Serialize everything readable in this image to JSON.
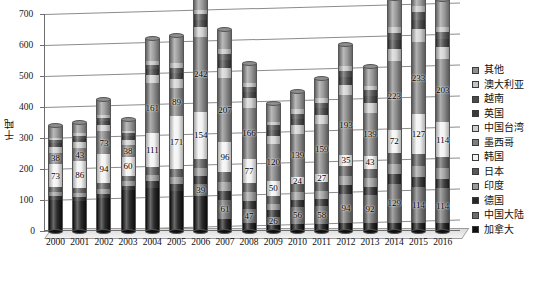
{
  "chart_data": {
    "type": "bar",
    "subtype": "stacked-column-3d",
    "title": "",
    "xlabel": "",
    "ylabel": "千吨",
    "ylim": [
      0,
      700
    ],
    "ytick_step": 100,
    "yticks": [
      0,
      100,
      200,
      300,
      400,
      500,
      600,
      700
    ],
    "grid": true,
    "legend_position": "right",
    "categories": [
      "2000",
      "2001",
      "2002",
      "2003",
      "2004",
      "2005",
      "2006",
      "2007",
      "2008",
      "2009",
      "2010",
      "2011",
      "2012",
      "2013",
      "2014",
      "2015",
      "2016"
    ],
    "series": [
      {
        "name": "加拿大",
        "color": "#101010",
        "values": [
          100,
          97,
          106,
          133,
          140,
          128,
          114,
          40,
          25,
          20,
          22,
          22,
          26,
          24,
          24,
          27,
          24
        ]
      },
      {
        "name": "中国大陆",
        "color": "#6d6d6d",
        "values": [
          0,
          0,
          0,
          0,
          0,
          0,
          39,
          61,
          47,
          26,
          56,
          58,
          94,
          92,
          129,
          114,
          114
        ]
      },
      {
        "name": "德国",
        "color": "#272727",
        "values": [
          12,
          12,
          14,
          13,
          20,
          22,
          24,
          27,
          25,
          20,
          22,
          24,
          28,
          26,
          30,
          34,
          30
        ]
      },
      {
        "name": "印度",
        "color": "#9a9a9a",
        "values": [
          14,
          14,
          16,
          15,
          22,
          24,
          26,
          30,
          28,
          22,
          24,
          26,
          30,
          28,
          34,
          36,
          34
        ]
      },
      {
        "name": "日本",
        "color": "#585858",
        "values": [
          16,
          16,
          18,
          17,
          24,
          26,
          28,
          32,
          30,
          24,
          26,
          28,
          32,
          30,
          36,
          38,
          36
        ]
      },
      {
        "name": "韩国",
        "color": "#f2f2f2",
        "values": [
          73,
          86,
          94,
          60,
          111,
          171,
          154,
          96,
          77,
          50,
          24,
          27,
          35,
          43,
          72,
          127,
          114
        ]
      },
      {
        "name": "墨西哥",
        "color": "#7e7e7e",
        "values": [
          38,
          43,
          73,
          38,
          161,
          89,
          242,
          207,
          166,
          120,
          139,
          159,
          193,
          139,
          223,
          233,
          203
        ]
      },
      {
        "name": "中国台湾",
        "color": "#cfcfcf",
        "values": [
          18,
          18,
          20,
          18,
          26,
          30,
          32,
          34,
          30,
          26,
          28,
          30,
          34,
          32,
          40,
          42,
          38
        ]
      },
      {
        "name": "英国",
        "color": "#3a3a3a",
        "values": [
          12,
          12,
          13,
          12,
          18,
          20,
          22,
          24,
          20,
          18,
          20,
          22,
          24,
          22,
          28,
          30,
          26
        ]
      },
      {
        "name": "越南",
        "color": "#4a4a4a",
        "values": [
          10,
          10,
          11,
          10,
          15,
          17,
          18,
          20,
          17,
          15,
          17,
          18,
          20,
          18,
          23,
          25,
          22
        ]
      },
      {
        "name": "澳大利亚",
        "color": "#c4c4c4",
        "values": [
          8,
          8,
          9,
          8,
          12,
          14,
          15,
          16,
          14,
          12,
          14,
          15,
          16,
          15,
          19,
          20,
          18
        ]
      },
      {
        "name": "其他",
        "color": "#8f8f8f",
        "values": [
          37,
          34,
          49,
          34,
          71,
          89,
          76,
          63,
          61,
          57,
          58,
          62,
          68,
          61,
          92,
          94,
          85
        ]
      }
    ],
    "data_labels": {
      "2000": {
        "加拿大": "",
        "韩国": "73",
        "墨西哥": "38"
      },
      "2001": {
        "加拿大": "",
        "韩国": "86",
        "墨西哥": "43"
      },
      "2002": {
        "加拿大": "",
        "韩国": "94",
        "墨西哥": "73"
      },
      "2003": {
        "加拿大": "",
        "韩国": "60",
        "墨西哥": "38"
      },
      "2004": {
        "加拿大": "",
        "韩国": "111",
        "墨西哥": "161"
      },
      "2005": {
        "中国大陆": "",
        "韩国": "171",
        "墨西哥": "89"
      },
      "2006": {
        "中国大陆": "39",
        "韩国": "154",
        "墨西哥": "242"
      },
      "2007": {
        "中国大陆": "61",
        "韩国": "96",
        "墨西哥": "207"
      },
      "2008": {
        "中国大陆": "47",
        "韩国": "77",
        "墨西哥": "166"
      },
      "2009": {
        "中国大陆": "26",
        "韩国": "50",
        "墨西哥": "120"
      },
      "2010": {
        "中国大陆": "56",
        "韩国": "24",
        "墨西哥": "139"
      },
      "2011": {
        "中国大陆": "58",
        "韩国": "27",
        "墨西哥": "159"
      },
      "2012": {
        "中国大陆": "94",
        "韩国": "35",
        "墨西哥": "193"
      },
      "2013": {
        "中国大陆": "92",
        "韩国": "43",
        "墨西哥": "139"
      },
      "2014": {
        "中国大陆": "129",
        "韩国": "72",
        "墨西哥": "223"
      },
      "2015": {
        "中国大陆": "114",
        "韩国": "127",
        "墨西哥": "233"
      },
      "2016": {
        "中国大陆": "114",
        "韩国": "114",
        "墨西哥": "203"
      }
    }
  },
  "axis": {
    "y_title": "千吨",
    "y_labels": [
      "700",
      "600",
      "500",
      "400",
      "300",
      "200",
      "100",
      "0"
    ],
    "x_labels": [
      "2000",
      "2001",
      "2002",
      "2003",
      "2004",
      "2005",
      "2006",
      "2007",
      "2008",
      "2009",
      "2010",
      "2011",
      "2012",
      "2013",
      "2014",
      "2015",
      "2016"
    ]
  },
  "legend": {
    "items": [
      {
        "label": "其他",
        "color": "#8f8f8f"
      },
      {
        "label": "澳大利亚",
        "color": "#c4c4c4"
      },
      {
        "label": "越南",
        "color": "#4a4a4a"
      },
      {
        "label": "英国",
        "color": "#3a3a3a"
      },
      {
        "label": "中国台湾",
        "color": "#cfcfcf"
      },
      {
        "label": "墨西哥",
        "color": "#7e7e7e"
      },
      {
        "label": "韩国",
        "color": "#f2f2f2"
      },
      {
        "label": "日本",
        "color": "#585858"
      },
      {
        "label": "印度",
        "color": "#9a9a9a"
      },
      {
        "label": "德国",
        "color": "#272727"
      },
      {
        "label": "中国大陆",
        "color": "#6d6d6d"
      },
      {
        "label": "加拿大",
        "color": "#101010"
      }
    ]
  }
}
